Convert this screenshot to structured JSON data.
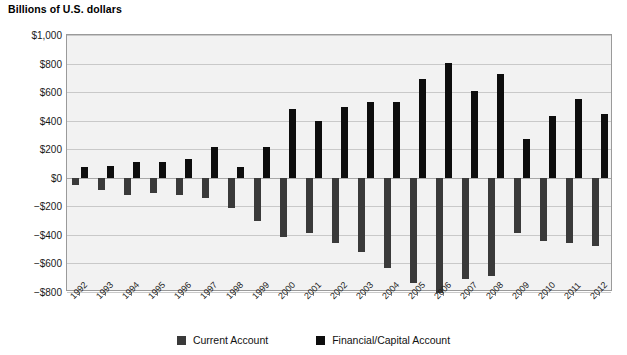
{
  "title": "Billions of U.S. dollars",
  "legend": {
    "items": [
      {
        "label": "Current Account",
        "color": "#3a3a3a",
        "key": "current"
      },
      {
        "label": "Financial/Capital Account",
        "color": "#0d0d0d",
        "key": "financial"
      }
    ]
  },
  "axis": {
    "y_ticks": [
      "$1,000",
      "$800",
      "$600",
      "$400",
      "$200",
      "$0",
      "−$200",
      "−$400",
      "−$600",
      "−$800"
    ],
    "y_tick_values": [
      1000,
      800,
      600,
      400,
      200,
      0,
      -200,
      -400,
      -600,
      -800
    ]
  },
  "chart_data": {
    "type": "bar",
    "title": "Billions of U.S. dollars",
    "xlabel": "",
    "ylabel": "Billions of U.S. dollars",
    "ylim": [
      -800,
      1000
    ],
    "grid": true,
    "legend_position": "bottom",
    "categories": [
      "1992",
      "1993",
      "1994",
      "1995",
      "1996",
      "1997",
      "1998",
      "1999",
      "2000",
      "2001",
      "2002",
      "2003",
      "2004",
      "2005",
      "2006",
      "2007",
      "2008",
      "2009",
      "2010",
      "2011",
      "2012"
    ],
    "series": [
      {
        "name": "Current Account",
        "color": "#3a3a3a",
        "values": [
          -50,
          -85,
          -120,
          -110,
          -120,
          -140,
          -215,
          -300,
          -415,
          -390,
          -460,
          -520,
          -630,
          -740,
          -805,
          -710,
          -690,
          -385,
          -445,
          -460,
          -475
        ]
      },
      {
        "name": "Financial/Capital Account",
        "color": "#0d0d0d",
        "values": [
          75,
          85,
          110,
          110,
          130,
          215,
          75,
          215,
          480,
          400,
          495,
          530,
          530,
          690,
          805,
          610,
          730,
          270,
          435,
          550,
          445
        ]
      }
    ]
  }
}
